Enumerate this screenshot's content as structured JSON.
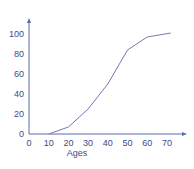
{
  "chart_data": {
    "type": "line",
    "title": "",
    "xlabel": "Ages",
    "ylabel": "",
    "x_ticks": [
      "0",
      "10",
      "20",
      "30",
      "40",
      "50",
      "60",
      "70"
    ],
    "y_ticks": [
      "0",
      "20",
      "40",
      "60",
      "80",
      "100"
    ],
    "xlim": [
      0,
      75
    ],
    "ylim": [
      0,
      105
    ],
    "grid": false,
    "legend": null,
    "series": [
      {
        "name": "cumulative",
        "x": [
          10,
          20,
          30,
          40,
          50,
          60,
          72
        ],
        "y": [
          0,
          7,
          25,
          50,
          84,
          97,
          101
        ]
      }
    ],
    "colors": {
      "axis": "#5b6aa8",
      "line": "#6f7cb4",
      "text": "#3b4a8a"
    }
  }
}
